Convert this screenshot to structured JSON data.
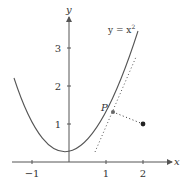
{
  "diagram": {
    "type": "function-plot",
    "function_label": "y = x²",
    "function_label_parts": {
      "lhs": "y = x",
      "exp": "2"
    },
    "axes": {
      "x_label": "x",
      "y_label": "y",
      "x_ticks": [
        {
          "value": -1,
          "label": "−1"
        },
        {
          "value": 1,
          "label": "1"
        },
        {
          "value": 2,
          "label": "2"
        }
      ],
      "y_ticks": [
        {
          "value": 1,
          "label": "1"
        },
        {
          "value": 2,
          "label": "2"
        },
        {
          "value": 3,
          "label": "3"
        }
      ]
    },
    "point_P": {
      "label": "P",
      "x": 1.15,
      "y": 1.3225
    },
    "external_point": {
      "x": 2,
      "y": 1
    },
    "tangent_at_P": {
      "style": "dotted"
    },
    "segment_P_to_point": {
      "style": "dotted"
    },
    "colors": {
      "curve": "#555555",
      "axes": "#555555",
      "point": "#222222",
      "text": "#333333"
    }
  }
}
